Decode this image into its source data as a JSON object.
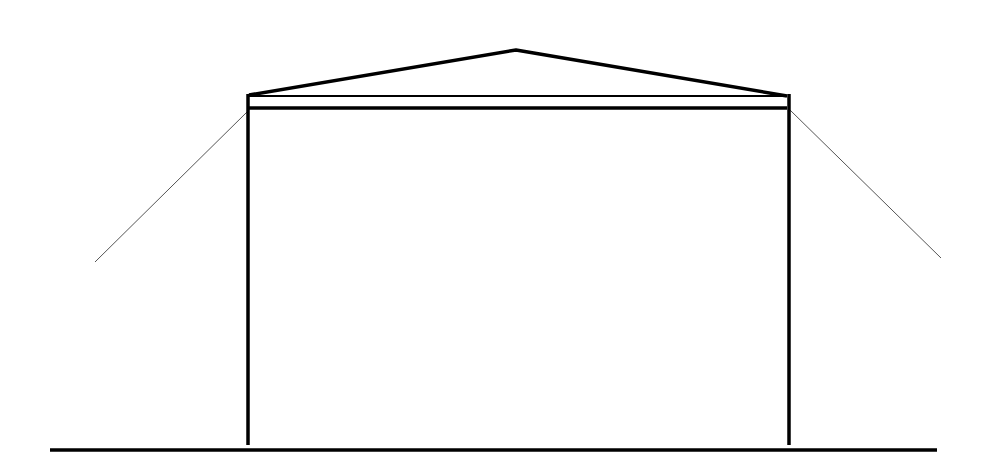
{
  "diagram": {
    "type": "elevation-line-drawing",
    "colors": {
      "background": "#ffffff",
      "stroke": "#000000",
      "guy_line": "#555555"
    },
    "roof": {
      "left": [
        249,
        96
      ],
      "peak": [
        516,
        50
      ],
      "right": [
        787,
        96
      ]
    },
    "valance": {
      "x1": 249,
      "y1": 96,
      "x2": 787,
      "y2": 108
    },
    "posts": [
      {
        "x": 248,
        "top": 96,
        "bottom": 445
      },
      {
        "x": 789,
        "top": 96,
        "bottom": 445
      }
    ],
    "guy_lines": [
      {
        "from": [
          247,
          112
        ],
        "to": [
          95,
          262
        ]
      },
      {
        "from": [
          790,
          110
        ],
        "to": [
          941,
          258
        ]
      }
    ],
    "ground": {
      "x1": 50,
      "x2": 937,
      "y": 450
    }
  }
}
